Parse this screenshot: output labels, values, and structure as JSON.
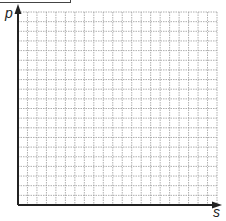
{
  "diagram": {
    "type": "blank-graph-grid",
    "y_axis_label": "p",
    "x_axis_label": "s",
    "grid": {
      "columns": 21,
      "rows": 20,
      "line_style": "dotted",
      "line_color": "#9a9a9a"
    },
    "axis_color": "#222222"
  },
  "chart_data": {
    "type": "line",
    "title": "",
    "xlabel": "s",
    "ylabel": "p",
    "series": [],
    "grid": true
  }
}
